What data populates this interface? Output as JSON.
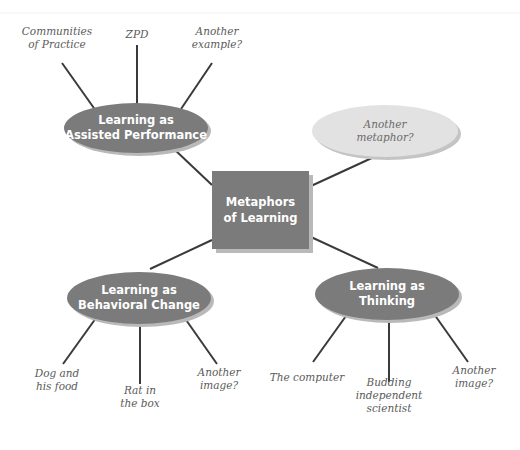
{
  "diagram": {
    "center": {
      "lines": [
        "Metaphors",
        "of Learning"
      ],
      "x": 212,
      "y": 171,
      "w": 97,
      "h": 78
    },
    "colors": {
      "node": "#7b7b7b",
      "shadow": "#b9b9b9",
      "alt_node": "#e2e2e2",
      "edge": "#3a3a3a",
      "leaf_text": "#5a5a5a"
    },
    "metaphors": [
      {
        "id": "assisted-performance",
        "lines": [
          "Learning as",
          "Assisted Performance"
        ],
        "cx": 136,
        "cy": 128,
        "rx": 72,
        "ry": 25,
        "center_anchor": [
          212,
          185
        ],
        "node_anchor": [
          175,
          150
        ],
        "examples": [
          {
            "lines": [
              "Communities",
              "of Practice"
            ],
            "x": 57,
            "y": 38,
            "from": [
              62,
              63
            ],
            "to": [
              96,
              111
            ]
          },
          {
            "lines": [
              "ZPD"
            ],
            "x": 137,
            "y": 35,
            "from": [
              137,
              45
            ],
            "to": [
              137,
              104
            ]
          },
          {
            "lines": [
              "Another",
              "example?"
            ],
            "x": 217,
            "y": 38,
            "from": [
              212,
              63
            ],
            "to": [
              181,
              109
            ]
          }
        ]
      },
      {
        "id": "another-metaphor",
        "lines": [
          "Another",
          "metaphor?"
        ],
        "cx": 385,
        "cy": 131,
        "rx": 73,
        "ry": 26,
        "alt": true,
        "center_anchor": [
          311,
          186
        ],
        "node_anchor": [
          374,
          157
        ],
        "examples": []
      },
      {
        "id": "behavioral-change",
        "lines": [
          "Learning as",
          "Behavioral Change"
        ],
        "cx": 139,
        "cy": 298,
        "rx": 72,
        "ry": 26,
        "center_anchor": [
          212,
          240
        ],
        "node_anchor": [
          150,
          269
        ],
        "examples": [
          {
            "lines": [
              "Dog and",
              "his food"
            ],
            "x": 57,
            "y": 380,
            "from": [
              63,
              364
            ],
            "to": [
              96,
              318
            ]
          },
          {
            "lines": [
              "Rat in",
              "the box"
            ],
            "x": 140,
            "y": 397,
            "from": [
              140,
              384
            ],
            "to": [
              140,
              322
            ]
          },
          {
            "lines": [
              "Another",
              "image?"
            ],
            "x": 219,
            "y": 379,
            "from": [
              217,
              364
            ],
            "to": [
              184,
              317
            ]
          }
        ]
      },
      {
        "id": "thinking",
        "lines": [
          "Learning as",
          "Thinking"
        ],
        "cx": 387,
        "cy": 294,
        "rx": 72,
        "ry": 26,
        "center_anchor": [
          311,
          237
        ],
        "node_anchor": [
          378,
          268
        ],
        "examples": [
          {
            "lines": [
              "The computer"
            ],
            "x": 307,
            "y": 378,
            "from": [
              313,
              362
            ],
            "to": [
              346,
              316
            ]
          },
          {
            "lines": [
              "Budding",
              "independent",
              "scientist"
            ],
            "x": 389,
            "y": 396,
            "from": [
              389,
              382
            ],
            "to": [
              389,
              321
            ]
          },
          {
            "lines": [
              "Another",
              "image?"
            ],
            "x": 474,
            "y": 377,
            "from": [
              468,
              362
            ],
            "to": [
              434,
              314
            ]
          }
        ]
      }
    ]
  }
}
